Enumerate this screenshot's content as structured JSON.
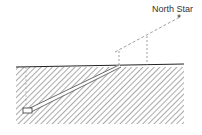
{
  "diagram": {
    "labels": {
      "star": "North Star"
    },
    "colors": {
      "line": "#333333",
      "hatch": "#555555",
      "dashed": "#777777",
      "background": "#ffffff"
    }
  }
}
